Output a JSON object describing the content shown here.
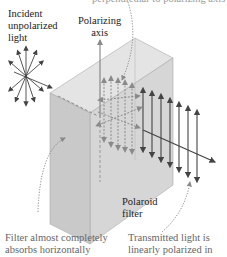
{
  "figure": {
    "top_cutoff_text": "perpendicular to polarizing axis",
    "labels": {
      "incident": [
        "Incident",
        "unpolarized",
        "light"
      ],
      "axis": [
        "Polarizing",
        "axis"
      ],
      "filter": [
        "Polaroid",
        "filter"
      ],
      "absorb": [
        "Filter almost completely",
        "absorbs horizontally"
      ],
      "transmit": [
        "Transmitted light is",
        "linearly polarized in"
      ]
    },
    "colors": {
      "box_front": "#d9d9d9",
      "box_side": "#c8c8c8",
      "box_top": "#e4e4e4",
      "dashed_arrows": "#8a8a8a",
      "solid_arrows": "#444444",
      "text": "#222222",
      "gray_text": "#666666"
    }
  }
}
